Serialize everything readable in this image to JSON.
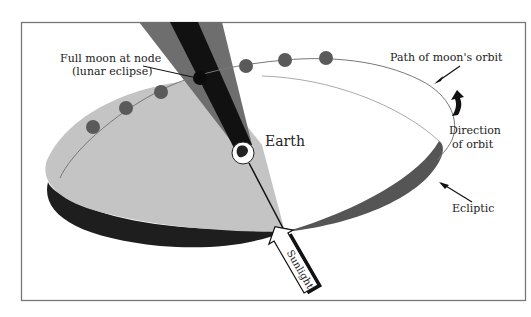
{
  "diagram": {
    "type": "lunar-eclipse-orbit-geometry",
    "labels": {
      "full_moon_line1": "Full moon at node",
      "full_moon_line2": "(lunar eclipse)",
      "path_of_orbit": "Path of moon's orbit",
      "direction_line1": "Direction",
      "direction_line2": "of orbit",
      "earth": "Earth",
      "ecliptic": "Ecliptic",
      "sunlight": "Sunlight"
    },
    "moon_count": 6,
    "colors": {
      "frame": "#777777",
      "orbit_plane": "#c4c4c4",
      "ecliptic_band": "#1e1e1e",
      "ecliptic_wedge": "#555555",
      "penumbra": "#6e6e6e",
      "umbra": "#111111",
      "moon": "#5a5a5a",
      "orbit_line": "#777777"
    }
  }
}
